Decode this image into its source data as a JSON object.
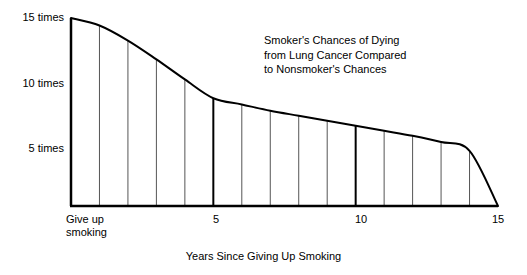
{
  "chart_data": {
    "type": "area",
    "title": "",
    "annotation": "Smoker's Chances of Dying\nfrom Lung Cancer Compared\nto Nonsmoker's Chances",
    "xlabel": "Years Since Giving Up Smoking",
    "ylabel": "",
    "xlim": [
      0,
      15
    ],
    "ylim": [
      0,
      16
    ],
    "grid": true,
    "legend": false,
    "x": [
      0,
      1,
      2,
      3,
      4,
      5,
      6,
      7,
      8,
      9,
      10,
      11,
      12,
      13,
      14,
      15
    ],
    "values": [
      15,
      14.4,
      13.2,
      11.7,
      10.1,
      8.6,
      8.1,
      7.6,
      7.2,
      6.8,
      6.4,
      6.0,
      5.6,
      5.1,
      4.4,
      0
    ],
    "y_ticks": [
      {
        "value": 15,
        "label": "15 times"
      },
      {
        "value": 10,
        "label": "10 times"
      },
      {
        "value": 5,
        "label": "5 times"
      }
    ],
    "x_ticks": [
      {
        "value": 0,
        "label": "Give up\nsmoking",
        "major": true
      },
      {
        "value": 5,
        "label": "5",
        "major": true
      },
      {
        "value": 10,
        "label": "10",
        "major": true
      },
      {
        "value": 15,
        "label": "15",
        "major": true
      }
    ],
    "gridline_years": [
      1,
      2,
      3,
      4,
      6,
      7,
      8,
      9,
      11,
      12,
      13,
      14
    ],
    "colors": {
      "curve": "#000000",
      "axis": "#000000",
      "gridline": "#555555",
      "background": "#ffffff"
    }
  },
  "axis": {
    "y_label_15": "15 times",
    "y_label_10": "10 times",
    "y_label_5": "5 times",
    "x_label_0": "Give up\nsmoking",
    "x_label_5": "5",
    "x_label_10": "10",
    "x_label_15": "15",
    "x_title": "Years Since Giving Up Smoking"
  },
  "annotation": {
    "text": "Smoker's Chances of Dying\nfrom Lung Cancer Compared\nto Nonsmoker's Chances"
  }
}
